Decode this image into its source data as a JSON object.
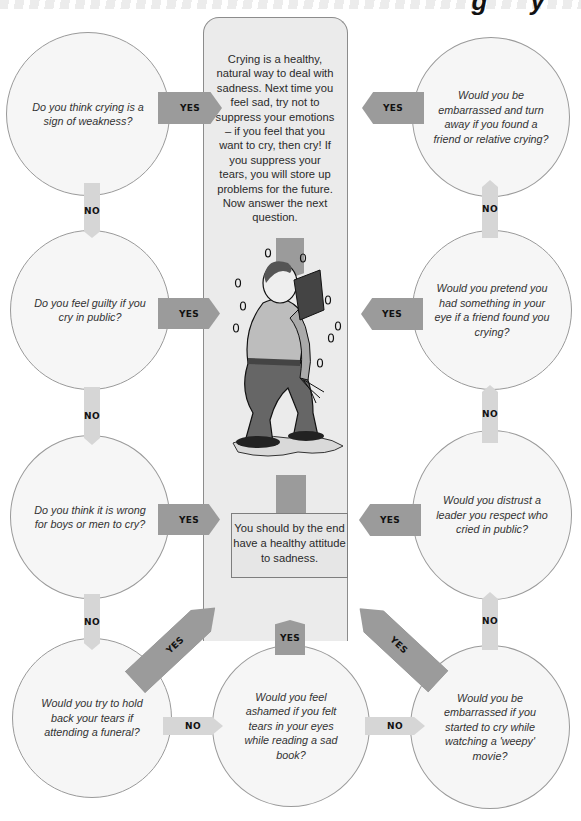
{
  "header": {
    "title_fragment": "g y"
  },
  "panel": {
    "advice_text": "Crying is a healthy, natural way to deal with sadness. Next time you feel sad, try not to suppress your emotions – if you feel that you want to cry, then cry! If you suppress your tears, you will store up problems for the future. Now answer the next question.",
    "illustration": "man-crying-reading-book",
    "end_text": "You should by the end have a healthy attitude to sadness."
  },
  "questions": {
    "left": [
      "Do you think crying is a sign of weakness?",
      "Do you feel guilty if you cry in public?",
      "Do you think it is wrong for boys or men to cry?",
      "Would you try to hold back your tears if attending a funeral?"
    ],
    "bottom_middle": "Would you feel ashamed if you felt tears in your eyes while reading a sad book?",
    "right": [
      "Would you be embarrassed and turn away if you found a friend or relative crying?",
      "Would you pretend you had something in your eye if a friend found you crying?",
      "Would you distrust a leader you respect who cried in public?",
      "Would you be embarrassed if you started to cry while watching a 'weepy' movie?"
    ]
  },
  "labels": {
    "yes": "YES",
    "no": "NO"
  },
  "colors": {
    "yes_arrow": "#9b9b9b",
    "no_arrow": "#d6d6d6",
    "panel": "#ebebeb",
    "circle": "#f6f6f6"
  }
}
